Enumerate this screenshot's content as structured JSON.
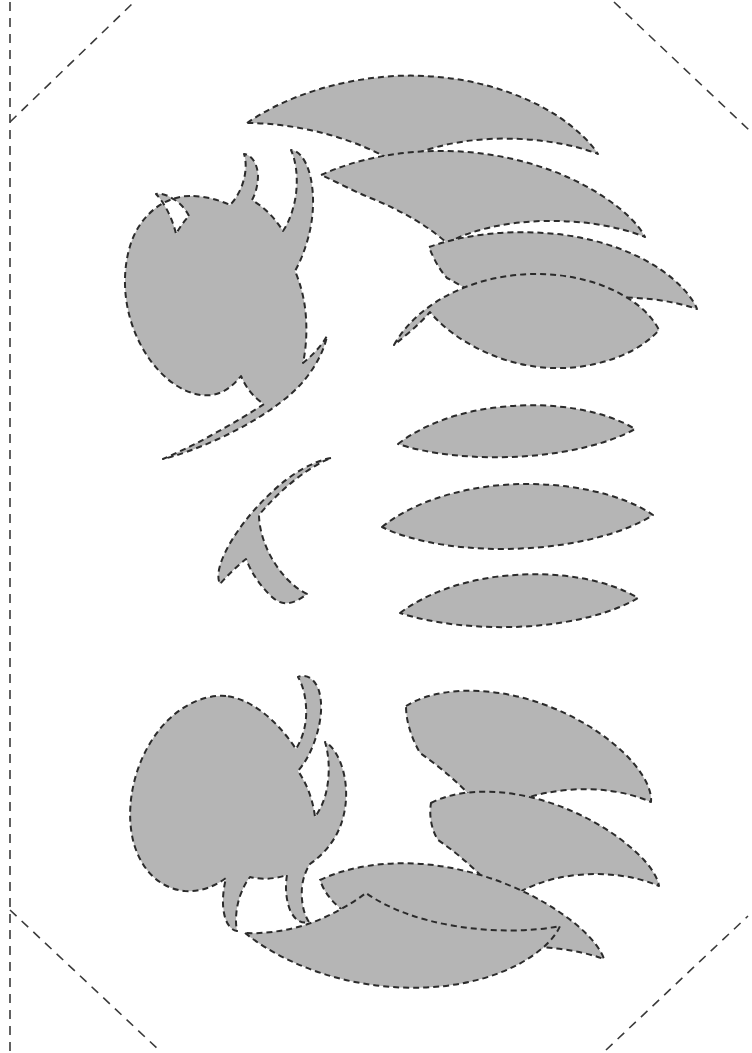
{
  "document": {
    "kind": "printable-pattern-sheet",
    "title": "Cut-out pattern template sheet",
    "page_width": 752,
    "page_height": 1053,
    "background_color": "#ffffff"
  },
  "style": {
    "piece_fill": "#b5b5b5",
    "cut_line_color": "#2b2b2b",
    "cut_line_width": 2.0,
    "cut_line_dash": "6 4",
    "guide_line_color": "#3a3a3a",
    "guide_line_width": 1.6,
    "guide_line_dash": "9 7"
  },
  "guides": {
    "label": "Trim and fold guide lines",
    "lines": [
      {
        "name": "left-margin-guide",
        "kind": "vertical",
        "points": "10,2 10,1051"
      },
      {
        "name": "top-left-corner-guide",
        "kind": "diagonal",
        "points": "10,122 134,2"
      },
      {
        "name": "top-right-corner-guide",
        "kind": "diagonal",
        "points": "614,2 749,130"
      },
      {
        "name": "bottom-left-corner-guide",
        "kind": "diagonal",
        "points": "10,910 160,1051"
      },
      {
        "name": "bottom-right-corner-guide",
        "kind": "diagonal",
        "points": "606,1050 748,916"
      }
    ]
  },
  "pieces": {
    "count": 12,
    "group_labels": {
      "left_column": "Body pieces",
      "right_column": "Shell / fin pieces",
      "center": "Crescent piece"
    },
    "items": [
      {
        "id": "piece-left-top-claw",
        "name": "claw-body-upper",
        "group": "left_column",
        "path": "M 190,196 C 165,196 141,214 131,243 C 120,276 124,316 143,349 C 162,382 190,398 212,395 C 224,393 233,386 241,376 C 246,388 254,398 264,404 C 252,412 232,424 210,436 C 192,446 174,454 163,459 C 176,456 196,449 216,440 C 245,427 273,410 292,393 C 312,375 324,352 327,336 C 322,345 313,355 303,363 C 306,349 307,333 306,318 C 305,301 301,285 295,271 C 299,264 303,255 306,245 C 314,221 315,195 310,175 C 306,159 298,150 291,150 C 296,161 298,177 296,194 C 294,209 289,222 283,231 C 275,218 264,207 252,200 C 256,193 258,184 258,175 C 257,162 251,155 244,154 C 247,163 246,176 241,188 C 238,195 234,201 230,205 C 217,199 204,196 190,196 Z M 189,216 C 186,210 181,204 175,200 C 168,195 161,193 156,194 C 161,199 166,207 170,216 C 173,223 175,229 176,234 C 180,227 184,221 189,216 Z",
        "subpaths": 2,
        "description": "Rounded body with three horn-like spikes and a swept tail"
      },
      {
        "id": "piece-left-center-crescent",
        "name": "crescent-boomerang",
        "group": "center",
        "path": "M 331,458 C 314,461 292,473 273,491 C 251,511 233,535 224,555 C 218,568 217,578 220,584 C 226,577 236,567 246,559 C 251,572 260,586 272,597 C 285,609 298,601 307,594 C 292,587 277,570 268,551 C 262,538 259,525 259,515 C 269,503 282,490 296,479 C 310,468 323,461 331,458 Z",
        "description": "Chevron / crescent shaped cut piece"
      },
      {
        "id": "piece-left-bottom-claw",
        "name": "claw-body-lower",
        "group": "left_column",
        "path": "M 226,696 C 200,694 171,710 152,740 C 132,771 125,812 134,844 C 143,874 163,889 185,891 C 200,892 214,887 226,878 C 223,890 222,903 224,913 C 226,924 231,930 237,931 C 235,921 236,908 240,896 C 243,888 246,882 250,877 C 262,880 275,879 287,875 C 285,887 286,900 290,910 C 295,921 302,924 309,922 C 303,913 301,900 302,887 C 303,878 306,870 310,864 C 323,855 334,842 340,827 C 348,807 348,783 341,764 C 337,753 331,745 325,742 C 329,755 330,772 327,788 C 325,800 320,810 315,817 C 313,800 307,784 298,771 C 305,763 311,752 315,740 C 322,720 323,701 318,688 C 313,677 305,674 298,677 C 304,687 307,702 306,718 C 305,730 301,741 296,749 C 276,719 251,699 226,696 Z",
        "subpaths": 1,
        "description": "Mirrored lower body piece with spikes and tail"
      },
      {
        "id": "piece-right-1",
        "name": "shell-crescent-1",
        "group": "right_column",
        "path": "M 247,123 C 286,96 340,79 395,76 C 455,73 515,88 559,117 C 578,130 591,143 598,154 C 570,143 530,137 489,139 C 452,141 419,150 396,163 C 378,152 355,142 330,135 C 302,127 272,123 247,123 Z",
        "description": "Wide shallow crescent, topmost"
      },
      {
        "id": "piece-right-2",
        "name": "shell-crescent-2",
        "group": "right_column",
        "path": "M 321,175 C 356,159 401,150 447,151 C 505,152 562,169 604,197 C 625,211 639,225 645,237 C 618,226 581,220 543,221 C 505,222 471,230 447,243 C 428,226 402,211 373,199 C 355,192 337,182 321,175 Z",
        "description": "Second crescent, offset right"
      },
      {
        "id": "piece-right-3",
        "name": "shell-crescent-3",
        "group": "right_column",
        "path": "M 429,247 C 463,235 504,230 544,233 C 596,236 644,254 673,279 C 686,290 694,301 697,309 C 671,300 637,296 602,298 C 565,300 533,309 510,322 C 493,305 470,290 447,278 C 438,268 433,257 429,247 Z",
        "description": "Third crescent, further right"
      },
      {
        "id": "piece-right-4",
        "name": "shell-fan-4",
        "group": "right_column",
        "path": "M 394,345 C 409,318 438,296 474,284 C 515,270 563,271 601,285 C 630,296 650,312 659,330 C 645,346 622,358 595,364 C 561,372 523,368 492,355 C 463,343 442,327 430,312 C 419,325 405,336 394,345 Z",
        "description": "Wide fan-shaped piece closing the upper stack"
      },
      {
        "id": "piece-right-5",
        "name": "lens-leaf-1",
        "group": "right_column",
        "path": "M 398,444 C 422,425 460,411 500,407 C 555,401 606,411 635,429 C 610,443 570,453 529,456 C 476,460 428,454 398,444 Z",
        "description": "Narrow lens/leaf piece"
      },
      {
        "id": "piece-right-6",
        "name": "lens-leaf-2",
        "group": "right_column",
        "path": "M 382,527 C 409,505 453,489 502,485 C 564,480 623,494 653,515 C 625,533 578,545 530,548 C 469,552 414,543 382,527 Z",
        "description": "Wider lens/leaf piece, center"
      },
      {
        "id": "piece-right-7",
        "name": "lens-leaf-3",
        "group": "right_column",
        "path": "M 400,613 C 425,594 463,580 503,576 C 558,570 609,580 638,598 C 613,613 573,623 532,626 C 479,630 430,623 400,613 Z",
        "description": "Narrow lens/leaf piece, lower"
      },
      {
        "id": "piece-right-8",
        "name": "shell-fan-8",
        "group": "right_column",
        "path": "M 406,706 C 427,693 458,688 492,692 C 545,698 597,725 628,757 C 645,775 652,791 651,802 C 628,792 598,787 567,790 C 534,793 507,803 489,817 C 471,794 446,771 420,753 C 411,737 406,721 406,706 Z",
        "description": "Fan-shaped upper piece of lower stack"
      },
      {
        "id": "piece-right-9",
        "name": "shell-crescent-9",
        "group": "right_column",
        "path": "M 431,803 C 452,792 482,789 514,794 C 566,802 616,830 644,860 C 653,870 658,879 659,886 C 636,876 606,872 577,875 C 546,878 521,889 505,902 C 487,880 463,857 438,840 C 431,829 429,815 431,803 Z",
        "description": "Second crescent in lower stack"
      },
      {
        "id": "piece-right-10",
        "name": "shell-crescent-10",
        "group": "right_column",
        "path": "M 320,880 C 347,867 384,861 423,864 C 482,869 540,894 578,926 C 592,938 601,950 604,959 C 576,949 541,945 506,948 C 469,951 437,962 414,977 C 395,953 368,928 340,908 C 329,899 323,889 320,880 Z",
        "description": "Third crescent in lower stack"
      },
      {
        "id": "piece-right-11",
        "name": "shell-fan-11",
        "group": "right_column",
        "path": "M 245,933 C 271,954 310,973 355,982 C 415,994 476,987 519,964 C 541,952 555,938 560,926 C 530,932 492,932 455,926 C 418,920 387,908 366,893 C 350,905 329,917 305,925 C 285,931 264,934 245,933 Z",
        "description": "Bottom-most wide fan piece"
      }
    ]
  }
}
